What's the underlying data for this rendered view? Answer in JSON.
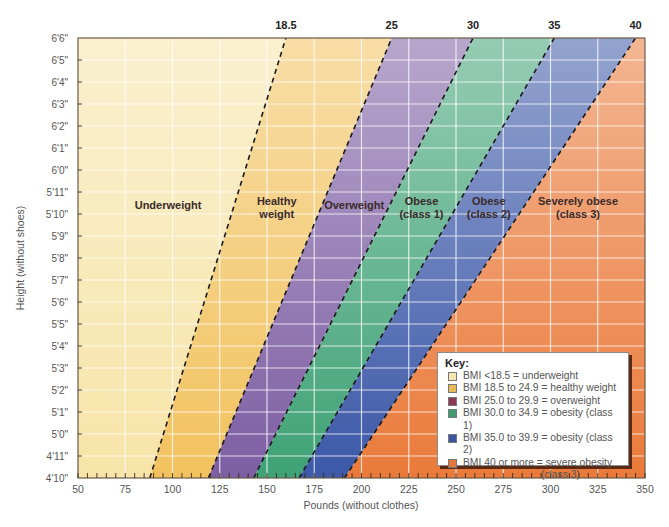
{
  "chart_data": {
    "type": "area",
    "title": "",
    "xlabel": "Pounds (without clothes)",
    "ylabel": "Height (without shoes)",
    "xlim": [
      50,
      350
    ],
    "x_ticks": [
      "50",
      "75",
      "100",
      "125",
      "150",
      "175",
      "200",
      "225",
      "250",
      "275",
      "300",
      "325",
      "350"
    ],
    "y_ticks": [
      "4'10\"",
      "4'11\"",
      "5'0\"",
      "5'1\"",
      "5'2\"",
      "5'3\"",
      "5'4\"",
      "5'5\"",
      "5'6\"",
      "5'7\"",
      "5'8\"",
      "5'9\"",
      "5'10\"",
      "5'11\"",
      "6'0\"",
      "6'1\"",
      "6'2\"",
      "6'3\"",
      "6'4\"",
      "6'5\"",
      "6'6\""
    ],
    "grid": true,
    "bmi_boundaries": [
      {
        "bmi": "18.5",
        "weight_at_4ft10": 88,
        "weight_at_6ft6": 160
      },
      {
        "bmi": "25",
        "weight_at_4ft10": 119,
        "weight_at_6ft6": 216
      },
      {
        "bmi": "30",
        "weight_at_4ft10": 143,
        "weight_at_6ft6": 259
      },
      {
        "bmi": "35",
        "weight_at_4ft10": 167,
        "weight_at_6ft6": 302
      },
      {
        "bmi": "40",
        "weight_at_4ft10": 191,
        "weight_at_6ft6": 345
      }
    ],
    "zones": [
      {
        "label_line1": "Underweight",
        "label_line2": "",
        "color": "#f7e4a8"
      },
      {
        "label_line1": "Healthy",
        "label_line2": "weight",
        "color": "#f2c25e"
      },
      {
        "label_line1": "Overweight",
        "label_line2": "",
        "color": "#7d5ea3"
      },
      {
        "label_line1": "Obese",
        "label_line2": "(class 1)",
        "color": "#3fa276"
      },
      {
        "label_line1": "Obese",
        "label_line2": "(class 2)",
        "color": "#3c58a8"
      },
      {
        "label_line1": "Severely obese",
        "label_line2": "(class 3)",
        "color": "#ea7a3a"
      }
    ],
    "legend_position": "bottom-right"
  },
  "key": {
    "title": "Key:",
    "items": [
      {
        "text": "BMI <18.5 = underweight",
        "color": "#f6e6b0"
      },
      {
        "text": "BMI 18.5 to 24.9 = healthy weight",
        "color": "#e9b859"
      },
      {
        "text": "BMI 25.0 to 29.9 = overweight",
        "color": "#8b3a55"
      },
      {
        "text": "BMI 30.0 to 34.9 = obesity (class 1)",
        "color": "#3f9a72"
      },
      {
        "text": "BMI 35.0 to 39.9 = obesity (class 2)",
        "color": "#3c55a0"
      },
      {
        "text": "BMI 40 or more = severe obesity",
        "color": "#e5773d"
      }
    ],
    "last_item_continuation": "(class 3)"
  }
}
